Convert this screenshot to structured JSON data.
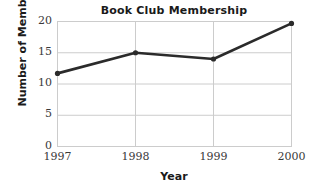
{
  "chart_data": {
    "type": "line",
    "title": "Book Club Membership",
    "xlabel": "Year",
    "ylabel": "Number of Members",
    "categories": [
      "1997",
      "1998",
      "1999",
      "2000"
    ],
    "x": [
      1997,
      1998,
      1999,
      2000
    ],
    "values": [
      11.7,
      15,
      14,
      19.7
    ],
    "series": [
      {
        "name": "Members",
        "values": [
          11.7,
          15,
          14,
          19.7
        ]
      }
    ],
    "ylim": [
      0,
      20
    ],
    "yticks": [
      0,
      5,
      10,
      15,
      20
    ],
    "ytick_labels": [
      "0",
      "5",
      "10",
      "15",
      "20"
    ],
    "xtick_labels": [
      "1997",
      "1998",
      "1999",
      "2000"
    ],
    "grid": true,
    "grid_color": "#cccccc",
    "legend": false,
    "legend_position": "none",
    "line_color": "#2b2b2b",
    "marker": "circle",
    "marker_color": "#2b2b2b",
    "background_color": "#ffffff",
    "text_color": "#1a1a1a"
  }
}
